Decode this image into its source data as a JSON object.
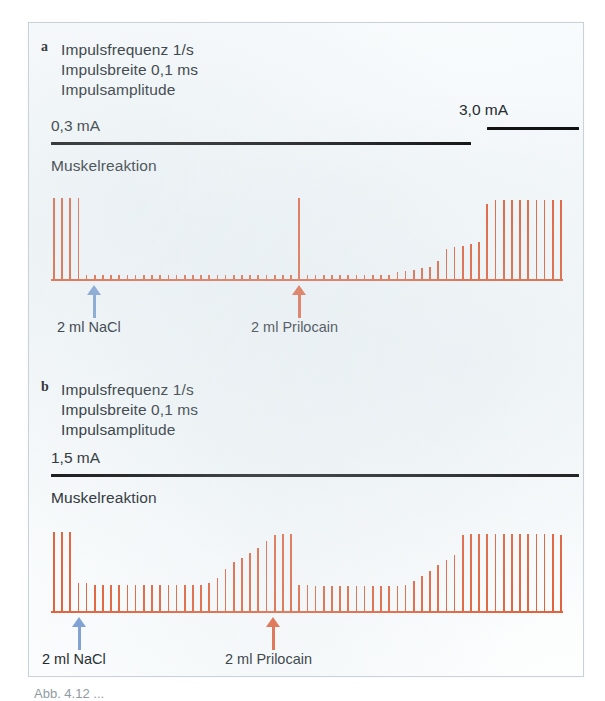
{
  "figure": {
    "panels": [
      {
        "id": "a",
        "letter": "a",
        "stim_lines": [
          "Impulsfrequenz 1/s",
          "Impulsbreite 0,1 ms",
          "Impulsamplitude"
        ],
        "amplitude_left": "0,3 mA",
        "amplitude_right": "3,0 mA",
        "response_label": "Muskelreaktion",
        "markers": [
          {
            "name": "nacl",
            "label": "2 ml NaCl",
            "color": "#7d9fd1",
            "x": 93
          },
          {
            "name": "prilocain",
            "label": "2 ml Prilocain",
            "color": "#e2603a",
            "x": 298
          }
        ]
      },
      {
        "id": "b",
        "letter": "b",
        "stim_lines": [
          "Impulsfrequenz 1/s",
          "Impulsbreite 0,1 ms",
          "Impulsamplitude"
        ],
        "amplitude_left": "1,5 mA",
        "amplitude_right": "",
        "response_label": "Muskelreaktion",
        "markers": [
          {
            "name": "nacl",
            "label": "2 ml NaCl",
            "color": "#7d9fd1",
            "x": 78
          },
          {
            "name": "prilocain",
            "label": "2 ml Prilocain",
            "color": "#e2603a",
            "x": 272
          }
        ]
      }
    ],
    "caption": "Abb. 4.12  ..."
  },
  "chart_data": {
    "type": "bar",
    "xlabel": "Zeit (Impulse, 1/s)",
    "ylabel": "Muskelreaktion (Amplitude, relativ)",
    "ylim": [
      0,
      100
    ],
    "grid": false,
    "legend": "none",
    "series": [
      {
        "name": "a - Impulsamplitude 0,3 mA (dann 3,0 mA)",
        "panel": "a",
        "stimulus_bars": [
          {
            "label": "0,3 mA",
            "from_index": 0,
            "to_index": 51
          },
          {
            "label": "3,0 mA",
            "from_index": 53,
            "to_index": 63
          }
        ],
        "markers": [
          {
            "label": "2 ml NaCl",
            "index": 5
          },
          {
            "label": "2 ml Prilocain",
            "index": 30
          }
        ],
        "values": [
          92,
          92,
          92,
          92,
          4,
          4,
          4,
          4,
          4,
          4,
          4,
          4,
          4,
          4,
          4,
          4,
          4,
          4,
          4,
          4,
          4,
          4,
          4,
          4,
          4,
          4,
          4,
          4,
          4,
          4,
          92,
          4,
          4,
          4,
          4,
          4,
          4,
          4,
          4,
          4,
          4,
          4,
          8,
          9,
          10,
          12,
          14,
          20,
          34,
          36,
          38,
          40,
          42,
          85,
          90,
          90,
          90,
          90,
          90,
          90,
          90,
          90,
          90
        ]
      },
      {
        "name": "b - Impulsamplitude 1,5 mA",
        "panel": "b",
        "stimulus_bars": [
          {
            "label": "1,5 mA",
            "from_index": 0,
            "to_index": 63
          }
        ],
        "markers": [
          {
            "label": "2 ml NaCl",
            "index": 3
          },
          {
            "label": "2 ml Prilocain",
            "index": 27
          }
        ],
        "values": [
          90,
          90,
          90,
          32,
          32,
          30,
          30,
          30,
          30,
          30,
          30,
          30,
          30,
          30,
          30,
          30,
          30,
          30,
          30,
          32,
          38,
          48,
          56,
          60,
          66,
          72,
          80,
          86,
          88,
          88,
          30,
          30,
          28,
          28,
          28,
          28,
          28,
          28,
          28,
          28,
          28,
          28,
          28,
          30,
          34,
          40,
          46,
          52,
          58,
          64,
          86,
          88,
          88,
          88,
          88,
          88,
          88,
          88,
          88,
          88,
          88,
          88,
          86
        ]
      }
    ]
  }
}
